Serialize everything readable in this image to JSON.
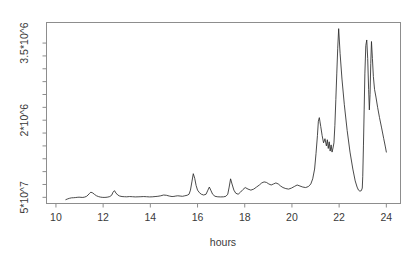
{
  "chart_data": {
    "type": "line",
    "title": "",
    "subtitle": "",
    "xlabel": "hours",
    "ylabel": "",
    "xlim": [
      9.6,
      24.6
    ],
    "ylim": [
      380000,
      3900000
    ],
    "grid": false,
    "legend": null,
    "annotations": [],
    "x_ticks": [
      10,
      12,
      14,
      16,
      18,
      20,
      22,
      24
    ],
    "x_tick_labels": [
      "10",
      "12",
      "14",
      "16",
      "18",
      "20",
      "22",
      "24"
    ],
    "y_ticks": [
      500000,
      2000000,
      3500000
    ],
    "y_tick_labels": [
      "5*10^7",
      "2*10^6",
      "3.5*10^6"
    ],
    "y_minor_ticks": [
      750000,
      1000000,
      1250000,
      1500000,
      1750000,
      2250000,
      2500000,
      2750000,
      3000000,
      3250000
    ],
    "series": [
      {
        "name": "signal",
        "color": "#2b2b2b",
        "x": [
          10.42,
          10.5,
          10.58,
          10.66,
          10.74,
          10.82,
          10.9,
          10.98,
          11.06,
          11.14,
          11.22,
          11.3,
          11.36,
          11.42,
          11.48,
          11.56,
          11.64,
          11.72,
          11.8,
          11.88,
          11.96,
          12.04,
          12.12,
          12.2,
          12.28,
          12.36,
          12.42,
          12.48,
          12.54,
          12.62,
          12.7,
          12.8,
          12.9,
          13.0,
          13.12,
          13.24,
          13.36,
          13.48,
          13.6,
          13.72,
          13.84,
          13.96,
          14.08,
          14.2,
          14.32,
          14.44,
          14.56,
          14.68,
          14.8,
          14.92,
          15.0,
          15.08,
          15.16,
          15.26,
          15.36,
          15.46,
          15.56,
          15.64,
          15.7,
          15.76,
          15.82,
          15.88,
          15.94,
          16.0,
          16.08,
          16.16,
          16.26,
          16.36,
          16.44,
          16.5,
          16.56,
          16.64,
          16.74,
          16.86,
          16.98,
          17.1,
          17.2,
          17.28,
          17.34,
          17.4,
          17.46,
          17.54,
          17.62,
          17.72,
          17.82,
          17.92,
          18.02,
          18.14,
          18.26,
          18.38,
          18.5,
          18.62,
          18.72,
          18.82,
          18.92,
          19.02,
          19.12,
          19.22,
          19.32,
          19.42,
          19.52,
          19.62,
          19.74,
          19.86,
          19.98,
          20.1,
          20.22,
          20.34,
          20.46,
          20.58,
          20.7,
          20.8,
          20.88,
          20.96,
          21.02,
          21.08,
          21.12,
          21.16,
          21.22,
          21.28,
          21.34,
          21.4,
          21.46,
          21.5,
          21.54,
          21.58,
          21.62,
          21.66,
          21.7,
          21.74,
          21.78,
          21.82,
          21.86,
          21.9,
          21.94,
          21.98,
          22.04,
          22.12,
          22.22,
          22.34,
          22.46,
          22.58,
          22.68,
          22.76,
          22.82,
          22.88,
          22.94,
          22.98,
          23.0,
          23.03,
          23.06,
          23.09,
          23.13,
          23.17,
          23.21,
          23.25,
          23.28,
          23.31,
          23.34,
          23.37,
          23.41,
          23.45,
          23.5,
          23.56,
          23.63,
          23.71,
          23.8,
          23.89,
          23.96,
          24.0
        ],
        "y": [
          455000,
          470000,
          482000,
          490000,
          492000,
          495000,
          500000,
          503000,
          500000,
          498000,
          505000,
          520000,
          545000,
          575000,
          600000,
          585000,
          555000,
          530000,
          515000,
          505000,
          500000,
          498000,
          500000,
          505000,
          515000,
          540000,
          600000,
          630000,
          585000,
          545000,
          525000,
          515000,
          512000,
          510000,
          515000,
          512000,
          508000,
          510000,
          512000,
          515000,
          512000,
          508000,
          510000,
          515000,
          520000,
          530000,
          545000,
          540000,
          525000,
          515000,
          518000,
          525000,
          530000,
          525000,
          520000,
          530000,
          540000,
          560000,
          640000,
          800000,
          960000,
          870000,
          730000,
          640000,
          590000,
          560000,
          545000,
          560000,
          640000,
          700000,
          640000,
          560000,
          520000,
          510000,
          508000,
          510000,
          520000,
          560000,
          700000,
          860000,
          760000,
          640000,
          580000,
          560000,
          600000,
          650000,
          690000,
          660000,
          640000,
          660000,
          700000,
          740000,
          780000,
          800000,
          790000,
          760000,
          740000,
          760000,
          780000,
          760000,
          720000,
          690000,
          670000,
          660000,
          680000,
          710000,
          740000,
          720000,
          700000,
          690000,
          710000,
          760000,
          860000,
          1050000,
          1350000,
          1700000,
          1980000,
          2050000,
          1880000,
          1700000,
          1560000,
          1640000,
          1500000,
          1620000,
          1450000,
          1580000,
          1400000,
          1520000,
          1380000,
          1460000,
          1560000,
          1900000,
          2400000,
          2900000,
          3400000,
          3780000,
          3300000,
          2800000,
          2300000,
          1800000,
          1380000,
          1050000,
          820000,
          700000,
          640000,
          620000,
          630000,
          680000,
          900000,
          1500000,
          2200000,
          2900000,
          3450000,
          3560000,
          3200000,
          2600000,
          2200000,
          2500000,
          3100000,
          3530000,
          3200000,
          2850000,
          2600000,
          2450000,
          2250000,
          2050000,
          1850000,
          1640000,
          1480000,
          1380000
        ]
      }
    ]
  },
  "axes": {
    "x_title": "hours"
  }
}
